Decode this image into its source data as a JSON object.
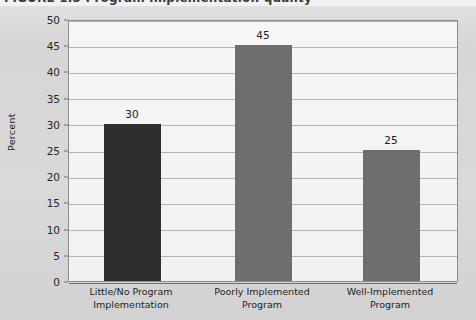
{
  "figure": {
    "title_fragment": "FIGURE 1.3  Program implementation quality",
    "background_color": "#d8d8d8",
    "plot_background_color": "#f4f4f4",
    "frame_color": "#8e8e8e",
    "gridline_color": "#9a9a9a"
  },
  "chart_data": {
    "type": "bar",
    "title": "FIGURE 1.3  Program implementation quality",
    "categories": [
      "Little/No Program Implementation",
      "Poorly Implemented Program",
      "Well-Implemented Program"
    ],
    "category_lines": [
      [
        "Little/No Program",
        "Implementation"
      ],
      [
        "Poorly Implemented",
        "Program"
      ],
      [
        "Well-Implemented",
        "Program"
      ]
    ],
    "values": [
      30,
      45,
      25
    ],
    "value_labels": [
      "30",
      "45",
      "25"
    ],
    "bar_colors": [
      "#2e2e2e",
      "#6e6e6e",
      "#6e6e6e"
    ],
    "xlabel": "",
    "ylabel": "Percent",
    "ylim": [
      0,
      50
    ],
    "ytick_step": 5,
    "yticks": [
      0,
      5,
      10,
      15,
      20,
      25,
      30,
      35,
      40,
      45,
      50
    ],
    "ytick_labels": [
      "0",
      "5",
      "10",
      "15",
      "20",
      "25",
      "30",
      "35",
      "40",
      "45",
      "50"
    ],
    "grid": true,
    "grid_axis": "y",
    "legend": false,
    "legend_position": "none"
  }
}
